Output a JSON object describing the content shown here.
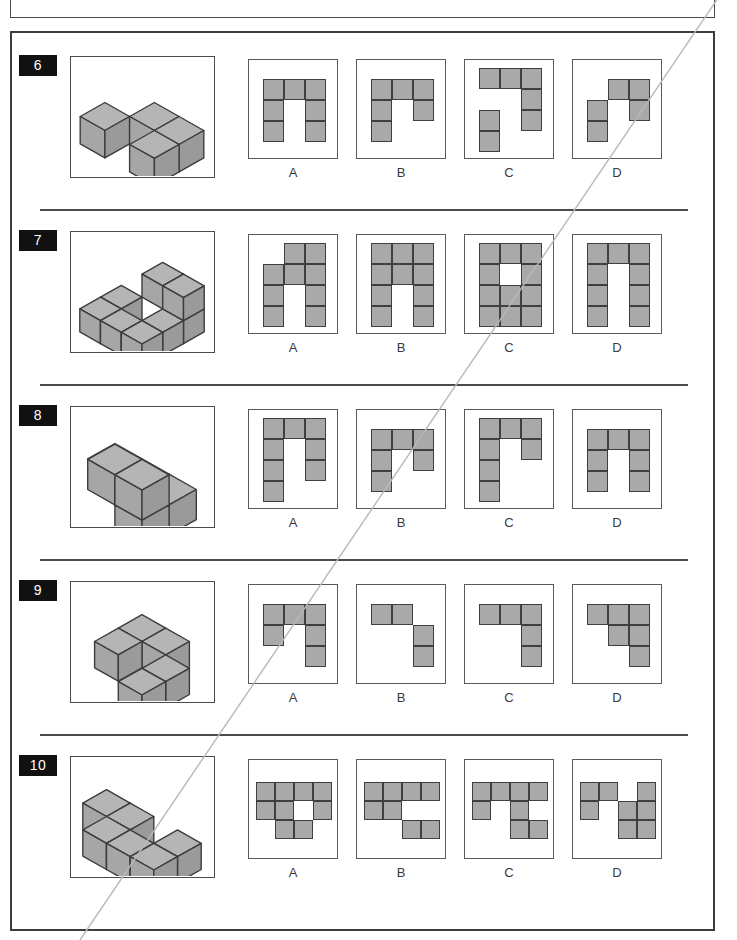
{
  "page": {
    "title": "Pictures 4",
    "width": 737,
    "height": 940,
    "background": "#ffffff",
    "cell_fill": "#a9a9a9",
    "cell_stroke": "#3f3f3f",
    "badge_background": "#111111",
    "badge_text_color": "#ffffff",
    "border_color": "#3d3d3d"
  },
  "option_labels": [
    "A",
    "B",
    "C",
    "D"
  ],
  "questions": [
    {
      "number": "6",
      "stimulus": {
        "name": "cube-assembly-6",
        "cubes": [
          {
            "x": 0,
            "y": 1,
            "z": 0
          },
          {
            "x": 1,
            "y": 0,
            "z": 0
          },
          {
            "x": 2,
            "y": 0,
            "z": 0
          },
          {
            "x": 2,
            "y": 1,
            "z": 0
          }
        ]
      },
      "options": [
        {
          "label": "A",
          "cols": 3,
          "rows": 3,
          "grid": [
            [
              1,
              1,
              1
            ],
            [
              1,
              0,
              1
            ],
            [
              1,
              0,
              1
            ]
          ]
        },
        {
          "label": "B",
          "cols": 3,
          "rows": 3,
          "grid": [
            [
              1,
              1,
              1
            ],
            [
              1,
              0,
              1
            ],
            [
              1,
              0,
              0
            ]
          ]
        },
        {
          "label": "C",
          "cols": 3,
          "rows": 4,
          "grid": [
            [
              1,
              1,
              1
            ],
            [
              0,
              0,
              1
            ],
            [
              1,
              0,
              1
            ],
            [
              1,
              0,
              0
            ]
          ]
        },
        {
          "label": "D",
          "cols": 3,
          "rows": 3,
          "grid": [
            [
              0,
              1,
              1
            ],
            [
              1,
              0,
              1
            ],
            [
              1,
              0,
              0
            ]
          ]
        }
      ]
    },
    {
      "number": "7",
      "stimulus": {
        "name": "cube-assembly-7",
        "cubes": [
          {
            "x": 0,
            "y": 1,
            "z": 0
          },
          {
            "x": 0,
            "y": 2,
            "z": 0
          },
          {
            "x": 1,
            "y": 2,
            "z": 0
          },
          {
            "x": 2,
            "y": 0,
            "z": 0
          },
          {
            "x": 2,
            "y": 1,
            "z": 0
          },
          {
            "x": 2,
            "y": 2,
            "z": 0
          },
          {
            "x": 1,
            "y": 0,
            "z": 1
          },
          {
            "x": 2,
            "y": 0,
            "z": 1
          }
        ]
      },
      "options": [
        {
          "label": "A",
          "cols": 3,
          "rows": 4,
          "grid": [
            [
              0,
              1,
              1
            ],
            [
              1,
              1,
              1
            ],
            [
              1,
              0,
              1
            ],
            [
              1,
              0,
              1
            ]
          ]
        },
        {
          "label": "B",
          "cols": 3,
          "rows": 4,
          "grid": [
            [
              1,
              1,
              1
            ],
            [
              1,
              1,
              1
            ],
            [
              1,
              0,
              1
            ],
            [
              1,
              0,
              1
            ]
          ]
        },
        {
          "label": "C",
          "cols": 3,
          "rows": 4,
          "grid": [
            [
              1,
              1,
              1
            ],
            [
              1,
              0,
              1
            ],
            [
              1,
              1,
              1
            ],
            [
              1,
              1,
              1
            ]
          ]
        },
        {
          "label": "D",
          "cols": 3,
          "rows": 4,
          "grid": [
            [
              1,
              1,
              1
            ],
            [
              1,
              0,
              1
            ],
            [
              1,
              0,
              1
            ],
            [
              1,
              0,
              1
            ]
          ]
        }
      ]
    },
    {
      "number": "8",
      "stimulus": {
        "name": "cube-assembly-8",
        "cubes": [
          {
            "x": 0,
            "y": 0,
            "z": 0
          },
          {
            "x": 1,
            "y": 0,
            "z": 0
          },
          {
            "x": 2,
            "y": 0,
            "z": 0
          },
          {
            "x": 2,
            "y": 1,
            "z": 0
          },
          {
            "x": 1,
            "y": 1,
            "z": 1
          },
          {
            "x": 2,
            "y": 1,
            "z": 1
          }
        ]
      },
      "options": [
        {
          "label": "A",
          "cols": 3,
          "rows": 4,
          "grid": [
            [
              1,
              1,
              1
            ],
            [
              1,
              0,
              1
            ],
            [
              1,
              0,
              1
            ],
            [
              1,
              0,
              0
            ]
          ]
        },
        {
          "label": "B",
          "cols": 3,
          "rows": 3,
          "grid": [
            [
              1,
              1,
              1
            ],
            [
              1,
              0,
              1
            ],
            [
              1,
              0,
              0
            ]
          ]
        },
        {
          "label": "C",
          "cols": 3,
          "rows": 4,
          "grid": [
            [
              1,
              1,
              1
            ],
            [
              1,
              0,
              1
            ],
            [
              1,
              0,
              0
            ],
            [
              1,
              0,
              0
            ]
          ]
        },
        {
          "label": "D",
          "cols": 3,
          "rows": 3,
          "grid": [
            [
              1,
              1,
              1
            ],
            [
              1,
              0,
              1
            ],
            [
              1,
              0,
              1
            ]
          ]
        }
      ]
    },
    {
      "number": "9",
      "stimulus": {
        "name": "cube-assembly-9",
        "cubes": [
          {
            "x": 0,
            "y": 0,
            "z": 0
          },
          {
            "x": 1,
            "y": 0,
            "z": 0
          },
          {
            "x": 0,
            "y": 1,
            "z": 0
          },
          {
            "x": 2,
            "y": 1,
            "z": 0
          },
          {
            "x": 2,
            "y": 2,
            "z": 0
          }
        ]
      },
      "options": [
        {
          "label": "A",
          "cols": 3,
          "rows": 3,
          "grid": [
            [
              1,
              1,
              1
            ],
            [
              1,
              0,
              1
            ],
            [
              0,
              0,
              1
            ]
          ]
        },
        {
          "label": "B",
          "cols": 3,
          "rows": 3,
          "grid": [
            [
              1,
              1,
              0
            ],
            [
              0,
              0,
              1
            ],
            [
              0,
              0,
              1
            ]
          ]
        },
        {
          "label": "C",
          "cols": 3,
          "rows": 3,
          "grid": [
            [
              1,
              1,
              1
            ],
            [
              0,
              0,
              1
            ],
            [
              0,
              0,
              1
            ]
          ]
        },
        {
          "label": "D",
          "cols": 3,
          "rows": 3,
          "grid": [
            [
              1,
              1,
              1
            ],
            [
              0,
              1,
              1
            ],
            [
              0,
              0,
              1
            ]
          ]
        }
      ]
    },
    {
      "number": "10",
      "stimulus": {
        "name": "cube-assembly-10",
        "cubes": [
          {
            "x": 0,
            "y": 0,
            "z": 0
          },
          {
            "x": 1,
            "y": 0,
            "z": 0
          },
          {
            "x": 3,
            "y": 0,
            "z": 0
          },
          {
            "x": 1,
            "y": 1,
            "z": 0
          },
          {
            "x": 2,
            "y": 1,
            "z": 0
          },
          {
            "x": 3,
            "y": 1,
            "z": 0
          }
        ]
      },
      "options": [
        {
          "label": "A",
          "cols": 4,
          "rows": 3,
          "grid": [
            [
              1,
              1,
              1,
              1
            ],
            [
              1,
              1,
              0,
              1
            ],
            [
              0,
              1,
              1,
              0
            ]
          ]
        },
        {
          "label": "B",
          "cols": 4,
          "rows": 3,
          "grid": [
            [
              1,
              1,
              1,
              1
            ],
            [
              1,
              1,
              0,
              0
            ],
            [
              0,
              0,
              1,
              1
            ]
          ]
        },
        {
          "label": "C",
          "cols": 4,
          "rows": 3,
          "grid": [
            [
              1,
              1,
              1,
              1
            ],
            [
              1,
              0,
              1,
              0
            ],
            [
              0,
              0,
              1,
              1
            ]
          ]
        },
        {
          "label": "D",
          "cols": 4,
          "rows": 3,
          "grid": [
            [
              1,
              1,
              0,
              1
            ],
            [
              1,
              0,
              1,
              1
            ],
            [
              0,
              0,
              1,
              1
            ]
          ]
        }
      ]
    }
  ]
}
